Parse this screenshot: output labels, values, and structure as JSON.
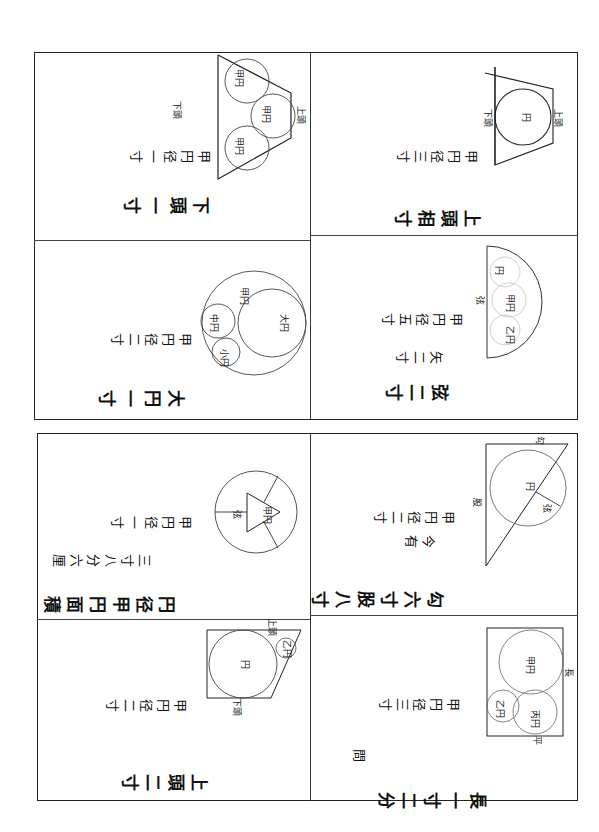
{
  "document": {
    "type": "wasan-sangaku-manuscript",
    "orientation": "rotated-90",
    "ink_color": "#111111",
    "paper_color": "#ffffff"
  },
  "frames": [
    {
      "id": "top",
      "panels": [
        {
          "id": "top-left-upper",
          "diagram": "three-circles-in-trapezoid",
          "captions": [
            "下頭一寸",
            "甲円径一寸"
          ],
          "labels": {
            "circles": [
              "甲円",
              "甲円",
              "甲円"
            ],
            "side_left": "下頭",
            "side_right": "上頭"
          }
        },
        {
          "id": "top-left-lower",
          "diagram": "three-circles-in-circle",
          "captions": [
            "大円一寸",
            "甲円径二寸"
          ],
          "labels": {
            "circles": [
              "大円",
              "中円",
              "小円",
              "甲円"
            ]
          }
        },
        {
          "id": "top-right-upper",
          "diagram": "circle-in-trapezoid",
          "captions": [
            "上頭相寸",
            "甲円径三寸"
          ],
          "labels": {
            "circle": "円",
            "side_left": "下頭",
            "side_right": "上頭"
          }
        },
        {
          "id": "top-right-lower",
          "diagram": "circles-in-semicircle",
          "captions": [
            "弦二寸",
            "矢二寸",
            "甲円径五寸"
          ],
          "labels": {
            "circles": [
              "円",
              "甲円",
              "乙円"
            ],
            "chord": "弦"
          }
        }
      ]
    },
    {
      "id": "bottom",
      "panels": [
        {
          "id": "bottom-left-upper",
          "diagram": "triangle-in-circle-with-radii",
          "captions": [
            "円径甲円面積",
            "三寸八分六厘",
            "甲円径一寸"
          ],
          "labels": {
            "triangle": "甲円",
            "segment": "弦"
          }
        },
        {
          "id": "bottom-left-lower",
          "diagram": "circle-in-trapezoid-with-small-circle",
          "captions": [
            "上頭二寸",
            "甲円径二寸"
          ],
          "labels": {
            "circle": "円",
            "small_circle": "乙円",
            "top": "上頭",
            "bottom": "下頭"
          }
        },
        {
          "id": "bottom-right-upper",
          "diagram": "circle-in-right-triangle",
          "captions": [
            "勾六寸股八寸",
            "今有",
            "甲円径二寸"
          ],
          "labels": {
            "circle": "円",
            "hyp_mark": "弦",
            "top": "勾",
            "left": "股"
          }
        },
        {
          "id": "bottom-right-lower",
          "diagram": "three-circles-in-rectangle",
          "captions": [
            "長一寸二分",
            "甲円径三寸",
            "問"
          ],
          "labels": {
            "circles": [
              "甲円",
              "乙円",
              "丙円"
            ],
            "side": "長",
            "bottom": "平"
          }
        }
      ]
    }
  ]
}
